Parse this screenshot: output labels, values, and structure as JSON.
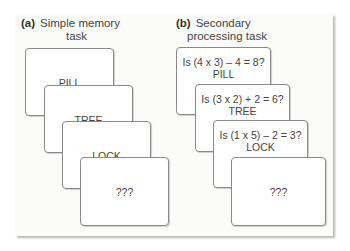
{
  "panel_a": {
    "tag": "(a)",
    "title_line1": "Simple memory",
    "title_line2": "task",
    "cards": [
      {
        "word": "PILL"
      },
      {
        "word": "TREE"
      },
      {
        "word": "LOCK"
      },
      {
        "word": "???"
      }
    ]
  },
  "panel_b": {
    "tag": "(b)",
    "title_line1": "Secondary",
    "title_line2": "processing task",
    "cards": [
      {
        "question": "Is (4 x 3) – 4 = 8?",
        "word": "PILL"
      },
      {
        "question": "Is (3 x 2) + 2 = 6?",
        "word": "TREE"
      },
      {
        "question": "Is (1 x 5) – 2 = 3?",
        "word": "LOCK"
      },
      {
        "word": "???"
      }
    ]
  }
}
